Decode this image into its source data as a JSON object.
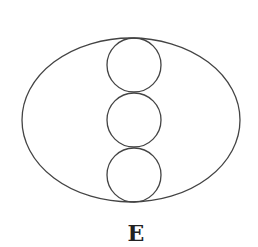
{
  "figure": {
    "label": "E",
    "stroke_color": "#444444",
    "background": "#ffffff",
    "ellipse": {
      "cx": 131,
      "cy": 120,
      "rx": 109,
      "ry": 82
    },
    "circles": [
      {
        "cx": 134,
        "cy": 65,
        "r": 27
      },
      {
        "cx": 134,
        "cy": 120,
        "r": 27
      },
      {
        "cx": 134,
        "cy": 175,
        "r": 27
      }
    ]
  }
}
